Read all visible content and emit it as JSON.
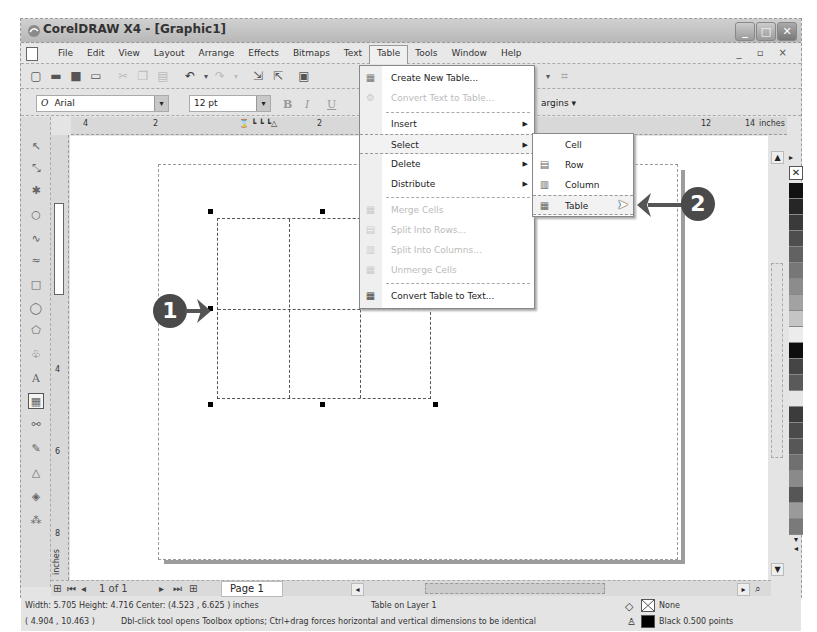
{
  "window": {
    "title": "CorelDRAW X4 - [Graphic1]",
    "controls": [
      "minimize",
      "maximize",
      "close"
    ]
  },
  "menubar": {
    "items": [
      {
        "label": "File"
      },
      {
        "label": "Edit"
      },
      {
        "label": "View"
      },
      {
        "label": "Layout"
      },
      {
        "label": "Arrange"
      },
      {
        "label": "Effects"
      },
      {
        "label": "Bitmaps"
      },
      {
        "label": "Text"
      },
      {
        "label": "Table",
        "active": true
      },
      {
        "label": "Tools"
      },
      {
        "label": "Window"
      },
      {
        "label": "Help"
      }
    ],
    "mdi_controls": "_ ▫ ×"
  },
  "standard_toolbar": {
    "icons": [
      "new-icon",
      "open-icon",
      "save-icon",
      "print-icon",
      "cut-icon",
      "copy-icon",
      "paste-icon",
      "undo-icon",
      "redo-icon",
      "import-icon",
      "export-icon",
      "app-launcher-icon"
    ]
  },
  "property_bar": {
    "font_name": "Arial",
    "font_size": "12 pt",
    "bold_label": "B",
    "italic_label": "I",
    "underline_label": "U",
    "margins_label": "argins"
  },
  "ruler": {
    "horizontal_labels": [
      "4",
      "2",
      "2",
      "12",
      "14"
    ],
    "unit_label": "inches",
    "vertical_labels": [
      "4",
      "6",
      "8"
    ],
    "vertical_unit": "inches"
  },
  "toolbox": {
    "tools": [
      "pick-tool",
      "shape-tool",
      "crop-tool",
      "zoom-tool",
      "freehand-tool",
      "smart-fill-tool",
      "rectangle-tool",
      "ellipse-tool",
      "polygon-tool",
      "basic-shapes-tool",
      "text-tool",
      "table-tool",
      "interactive-blend-tool",
      "eyedropper-tool",
      "outline-tool",
      "fill-tool",
      "interactive-fill-tool"
    ]
  },
  "table_menu": {
    "items": [
      {
        "label": "Create New Table...",
        "enabled": true,
        "icon": "table-new-icon"
      },
      {
        "label": "Convert Text to Table...",
        "enabled": false,
        "icon": "convert-icon"
      },
      {
        "label": "Insert",
        "enabled": true,
        "submenu": true
      },
      {
        "label": "Select",
        "enabled": true,
        "submenu": true,
        "highlighted": true
      },
      {
        "label": "Delete",
        "enabled": true,
        "submenu": true
      },
      {
        "label": "Distribute",
        "enabled": true,
        "submenu": true
      },
      {
        "label": "Merge Cells",
        "enabled": false,
        "icon": "merge-icon"
      },
      {
        "label": "Split Into Rows...",
        "enabled": false,
        "icon": "split-rows-icon"
      },
      {
        "label": "Split Into Columns...",
        "enabled": false,
        "icon": "split-columns-icon"
      },
      {
        "label": "Unmerge Cells",
        "enabled": false,
        "icon": "unmerge-icon"
      },
      {
        "label": "Convert Table to Text...",
        "enabled": true,
        "icon": "table-to-text-icon"
      }
    ]
  },
  "select_submenu": {
    "items": [
      {
        "label": "Cell"
      },
      {
        "label": "Row"
      },
      {
        "label": "Column"
      },
      {
        "label": "Table",
        "highlighted": true
      }
    ]
  },
  "callouts": [
    {
      "number": "1"
    },
    {
      "number": "2"
    }
  ],
  "page_nav": {
    "counter": "1 of 1",
    "page_tab": "Page 1"
  },
  "status": {
    "dimensions": "Width: 5.705  Height: 4.716  Center: (4.523 , 6.625 )  inches",
    "layer": "Table on Layer 1",
    "coords": "( 4.904 , 10.463 )",
    "hint": "Dbl-click tool opens Toolbox options; Ctrl+drag forces horizontal and vertical dimensions to be identical",
    "fill_label": "None",
    "outline_label": "Black  0.500 points"
  },
  "palette": {
    "swatches": [
      "#111111",
      "#262626",
      "#3a3a3a",
      "#4e4e4e",
      "#626262",
      "#777777",
      "#8c8c8c",
      "#a2a2a2",
      "#c4c4c4",
      "#ececec",
      "#0e0e0e",
      "#454545",
      "#5a5a5a",
      "#e6e6e6",
      "#3c3c3c",
      "#4b4b4b",
      "#575757",
      "#707070",
      "#8a8a8a",
      "#565656",
      "#9a9a9a",
      "#7a7a7a"
    ]
  }
}
